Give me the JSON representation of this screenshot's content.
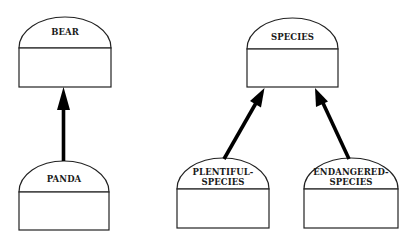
{
  "diagram": {
    "type": "class-hierarchy",
    "nodes": [
      {
        "id": "bear",
        "lines": [
          "BEAR"
        ]
      },
      {
        "id": "panda",
        "lines": [
          "PANDA"
        ]
      },
      {
        "id": "species",
        "lines": [
          "SPECIES"
        ]
      },
      {
        "id": "plentiful",
        "lines": [
          "PLENTIFUL-",
          "SPECIES"
        ]
      },
      {
        "id": "endangered",
        "lines": [
          "ENDANGERED-",
          "SPECIES"
        ]
      }
    ],
    "edges": [
      {
        "from": "panda",
        "to": "bear",
        "kind": "is-a"
      },
      {
        "from": "plentiful",
        "to": "species",
        "kind": "is-a"
      },
      {
        "from": "endangered",
        "to": "species",
        "kind": "is-a"
      }
    ],
    "colors": {
      "stroke": "#222222",
      "arrow": "#000000",
      "background": "#ffffff"
    }
  }
}
